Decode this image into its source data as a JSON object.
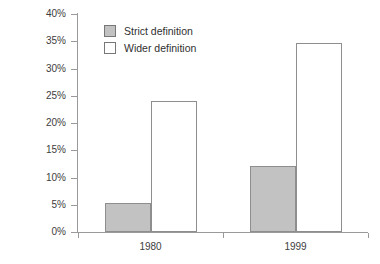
{
  "chart_data": {
    "type": "bar",
    "title": "",
    "subtitle": "",
    "xlabel": "",
    "ylabel": "",
    "categories": [
      "1980",
      "1999"
    ],
    "series": [
      {
        "name": "Strict definition",
        "color": "#c2c2c2",
        "values": [
          5.3,
          12.1
        ]
      },
      {
        "name": "Wider definition",
        "color": "#ffffff",
        "values": [
          24.1,
          34.7
        ]
      }
    ],
    "ylim": [
      0,
      40
    ],
    "ytick_step": 5,
    "ytick_labels": [
      "0%",
      "5%",
      "10%",
      "15%",
      "20%",
      "25%",
      "30%",
      "35%",
      "40%"
    ],
    "ytick_values": [
      0,
      5,
      10,
      15,
      20,
      25,
      30,
      35,
      40
    ],
    "value_suffix": "%",
    "grid": false,
    "legend_position": "top-left-inside",
    "axis_color": "#9a9a9a",
    "bar_border_color": "#8e8e8e",
    "background": "#ffffff"
  },
  "legend": {
    "items": [
      {
        "label": "Strict definition",
        "swatch": "strict"
      },
      {
        "label": "Wider definition",
        "swatch": "wider"
      }
    ]
  }
}
